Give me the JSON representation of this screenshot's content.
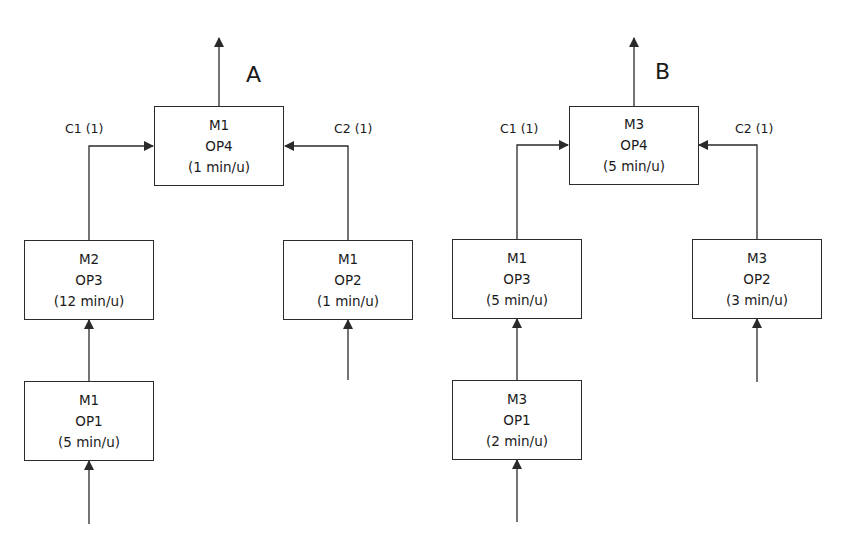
{
  "diagrams": [
    {
      "id": "A",
      "label": "A",
      "top": {
        "machine": "M1",
        "op": "OP4",
        "time": "(1 min/u)"
      },
      "left_component_label": "C1 (1)",
      "right_component_label": "C2 (1)",
      "left_mid": {
        "machine": "M2",
        "op": "OP3",
        "time": "(12 min/u)"
      },
      "left_bottom": {
        "machine": "M1",
        "op": "OP1",
        "time": "(5 min/u)"
      },
      "right_mid": {
        "machine": "M1",
        "op": "OP2",
        "time": "(1 min/u)"
      }
    },
    {
      "id": "B",
      "label": "B",
      "top": {
        "machine": "M3",
        "op": "OP4",
        "time": "(5 min/u)"
      },
      "left_component_label": "C1 (1)",
      "right_component_label": "C2 (1)",
      "left_mid": {
        "machine": "M1",
        "op": "OP3",
        "time": "(5 min/u)"
      },
      "left_bottom": {
        "machine": "M3",
        "op": "OP1",
        "time": "(2 min/u)"
      },
      "right_mid": {
        "machine": "M3",
        "op": "OP2",
        "time": "(3 min/u)"
      }
    }
  ],
  "colors": {
    "line": "#2a2a2a",
    "background": "#ffffff"
  }
}
